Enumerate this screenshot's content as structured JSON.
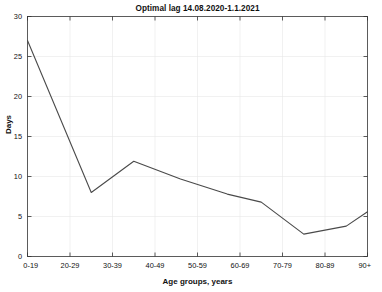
{
  "chart_data": {
    "type": "line",
    "title": "Optimal lag 14.08.2020-1.1.2021",
    "xlabel": "Age groups, years",
    "ylabel": "Days",
    "categories": [
      "0-19",
      "20-29",
      "30-39",
      "40-49",
      "50-59",
      "60-69",
      "70-79",
      "80-89",
      "90+"
    ],
    "x": [
      0,
      1.5,
      2.5,
      3.5,
      4.5,
      5.5,
      6.5,
      7.5,
      8
    ],
    "values": [
      27.0,
      8.0,
      11.9,
      9.7,
      7.8,
      6.8,
      2.8,
      3.8,
      5.6
    ],
    "series": [
      {
        "name": "Optimal lag",
        "color": "#4a4a4a",
        "points": [
          {
            "x": 0.0,
            "y": 27.0
          },
          {
            "x": 1.5,
            "y": 8.0
          },
          {
            "x": 2.5,
            "y": 11.9
          },
          {
            "x": 3.6,
            "y": 9.7
          },
          {
            "x": 4.7,
            "y": 7.8
          },
          {
            "x": 5.5,
            "y": 6.8
          },
          {
            "x": 6.5,
            "y": 2.8
          },
          {
            "x": 7.5,
            "y": 3.8
          },
          {
            "x": 8.0,
            "y": 5.6
          }
        ]
      }
    ],
    "xlim": [
      0,
      8
    ],
    "ylim": [
      0,
      30
    ],
    "yticks": [
      0,
      5,
      10,
      15,
      20,
      25,
      30
    ],
    "ytick_labels": [
      "0",
      "5",
      "10",
      "15",
      "20",
      "25",
      "30"
    ],
    "xticks": [
      0,
      1,
      2,
      3,
      4,
      5,
      6,
      7,
      8
    ],
    "grid": true,
    "legend": "none",
    "line_color": "#4a4a4a",
    "axis_color": "#333333",
    "grid_color": "#e8e8e8",
    "background": "#ffffff"
  }
}
